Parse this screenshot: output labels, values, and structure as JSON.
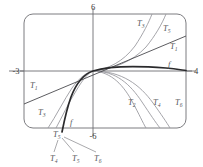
{
  "figure": {
    "viewport": {
      "xmin": -3,
      "xmax": 4,
      "ymin": -6,
      "ymax": 6
    },
    "axis_labels": {
      "top": "6",
      "left": "-3",
      "right": "4",
      "bottom": "-6"
    },
    "colors": {
      "frame": "#6e6e73",
      "axis": "#6e6e73",
      "function": "#2a2a2c",
      "taylor_light": "#9b9ba0",
      "taylor_mid": "#808085",
      "label": "#55555a",
      "background": "#ffffff"
    },
    "curve_labels": [
      {
        "id": "T3-top",
        "base": "T",
        "sub": "3",
        "x": 137,
        "y": 26
      },
      {
        "id": "T5-top",
        "base": "T",
        "sub": "5",
        "x": 163,
        "y": 31
      },
      {
        "id": "T1-right",
        "base": "T",
        "sub": "1",
        "x": 170,
        "y": 49
      },
      {
        "id": "f-right",
        "base": "f",
        "sub": "",
        "x": 168,
        "y": 67
      },
      {
        "id": "T1-left",
        "base": "T",
        "sub": "1",
        "x": 30,
        "y": 88
      },
      {
        "id": "T3-left",
        "base": "T",
        "sub": "3",
        "x": 38,
        "y": 115
      },
      {
        "id": "f-bottom",
        "base": "f",
        "sub": "",
        "x": 70,
        "y": 125
      },
      {
        "id": "T2-bottom",
        "base": "T",
        "sub": "2",
        "x": 128,
        "y": 105
      },
      {
        "id": "T4-bottom",
        "base": "T",
        "sub": "4",
        "x": 153,
        "y": 105
      },
      {
        "id": "T6-bottom",
        "base": "T",
        "sub": "6",
        "x": 175,
        "y": 105
      },
      {
        "id": "T5-callout",
        "base": "T",
        "sub": "5",
        "x": 53,
        "y": 137
      }
    ],
    "callout_labels": [
      {
        "id": "T4-callout",
        "base": "T",
        "sub": "4",
        "x": 50,
        "y": 161
      },
      {
        "id": "T5-callout-bottom",
        "base": "T",
        "sub": "5",
        "x": 72,
        "y": 161
      },
      {
        "id": "T6-callout",
        "base": "T",
        "sub": "6",
        "x": 94,
        "y": 161
      }
    ],
    "chart_data": {
      "type": "line",
      "title": "f and Taylor polynomials T1 through T6",
      "xlabel": "x",
      "ylabel": "y",
      "xlim": [
        -3,
        4
      ],
      "ylim": [
        -6,
        6
      ],
      "grid": false,
      "legend": "inline-curve-labels",
      "series": [
        {
          "name": "f",
          "style": "thick-dark",
          "description": "logarithm-like curve rising slowly to the right, plunging steeply down near x = -1"
        },
        {
          "name": "T1",
          "style": "thin-dark",
          "description": "straight tangent line through the origin region with positive slope"
        },
        {
          "name": "T2",
          "style": "thin-light",
          "description": "downward parabola branch falling to lower right"
        },
        {
          "name": "T3",
          "style": "thin-light",
          "description": "odd polynomial rising steeply upper right, falling lower left"
        },
        {
          "name": "T4",
          "style": "thin-light",
          "description": "even polynomial falling to lower right, slightly right of T2"
        },
        {
          "name": "T5",
          "style": "thin-light",
          "description": "odd polynomial rising steeply upper right, right of T3"
        },
        {
          "name": "T6",
          "style": "thin-light",
          "description": "even polynomial falling to lower right, right of T4"
        }
      ]
    }
  }
}
